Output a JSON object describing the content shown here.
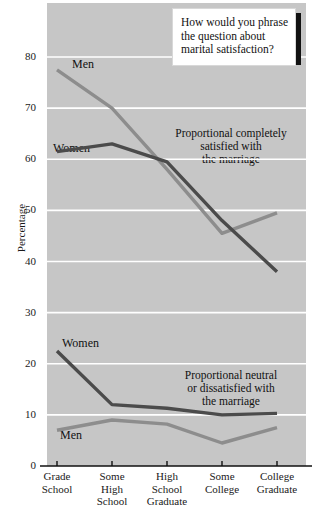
{
  "chart_data": {
    "type": "line",
    "title": "",
    "xlabel": "",
    "ylabel": "Percentage",
    "ylim": [
      0,
      85
    ],
    "yticks": [
      0,
      10,
      20,
      30,
      40,
      50,
      60,
      70,
      80
    ],
    "grid": true,
    "legend_position": "inline-labels",
    "categories": [
      "Grade School",
      "Some High School",
      "High School Graduate",
      "Some College",
      "College Graduate"
    ],
    "category_lines": [
      [
        "Grade",
        "School"
      ],
      [
        "Some",
        "High",
        "School"
      ],
      [
        "High",
        "School",
        "Graduate"
      ],
      [
        "Some",
        "College"
      ],
      [
        "College",
        "Graduate"
      ]
    ],
    "groups": [
      {
        "name": "Proportional completely satisfied with the marriage",
        "annotation": "Proportional completely\nsatisfied with\nthe marriage",
        "series": [
          {
            "name": "Men",
            "color": "#8d8d8d",
            "values": [
              77.5,
              70.0,
              58.0,
              45.5,
              49.5
            ]
          },
          {
            "name": "Women",
            "color": "#4b4b4b",
            "values": [
              61.5,
              63.0,
              59.5,
              48.0,
              38.0
            ]
          }
        ]
      },
      {
        "name": "Proportional neutral or dissatisfied with the marriage",
        "annotation": "Proportional neutral\nor dissatisfied with\nthe marriage",
        "series": [
          {
            "name": "Women",
            "color": "#4b4b4b",
            "values": [
              22.5,
              12.0,
              11.3,
              10.0,
              10.3
            ]
          },
          {
            "name": "Men",
            "color": "#8d8d8d",
            "values": [
              7.0,
              9.0,
              8.2,
              4.5,
              7.5
            ]
          }
        ]
      }
    ]
  },
  "callout": {
    "text": "How would you phrase the question about marital satisfaction?"
  },
  "series_labels": [
    {
      "text": "Men",
      "x": 72,
      "y": 57
    },
    {
      "text": "Women",
      "x": 53,
      "y": 141
    },
    {
      "text": "Women",
      "x": 62,
      "y": 336
    },
    {
      "text": "Men",
      "x": 60,
      "y": 428
    }
  ],
  "annotations": [
    {
      "text": "Proportional completely\nsatisfied with\nthe marriage",
      "x": 163,
      "y": 127,
      "width": 136
    },
    {
      "text": "Proportional neutral\nor dissatisfied with\nthe marriage",
      "x": 163,
      "y": 369,
      "width": 136
    }
  ],
  "colors": {
    "plot_background": "#c6c6c6",
    "gridline": "#ffffff",
    "axis": "#111111",
    "men_series": "#8d8d8d",
    "women_series": "#4b4b4b",
    "callout_background": "#ffffff",
    "callout_shadow": "#111111"
  }
}
